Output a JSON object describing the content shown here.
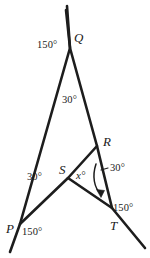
{
  "figure": {
    "type": "geometry-diagram",
    "stroke_color": "#1d1d1d",
    "background_color": "#ffffff",
    "width": 150,
    "height": 258
  },
  "points": {
    "Q": {
      "label": "Q",
      "x": 70,
      "y": 48
    },
    "P": {
      "label": "P",
      "x": 20,
      "y": 224
    },
    "R": {
      "label": "R",
      "x": 97,
      "y": 146
    },
    "S": {
      "label": "S",
      "x": 68,
      "y": 178
    },
    "T": {
      "label": "T",
      "x": 112,
      "y": 208
    }
  },
  "angles": {
    "q_exterior": "150°",
    "q_interior": "30°",
    "p_interior": "30°",
    "p_exterior": "150°",
    "s_unknown": "x°",
    "r_exterior": "30°",
    "t_exterior": "150°"
  },
  "segments": [
    {
      "name": "line-through-Q-to-P",
      "from": "above-Q",
      "to": "below-P"
    },
    {
      "name": "line-through-Q-to-T",
      "from": "above-Q",
      "to": "below-T"
    },
    {
      "name": "segment-P-to-R",
      "from": "P",
      "to": "R"
    },
    {
      "name": "segment-S-to-T",
      "from": "S",
      "to": "T"
    }
  ],
  "annotation": {
    "arrow": "curved-arrow-pointing-down-from-R-toward-T"
  }
}
